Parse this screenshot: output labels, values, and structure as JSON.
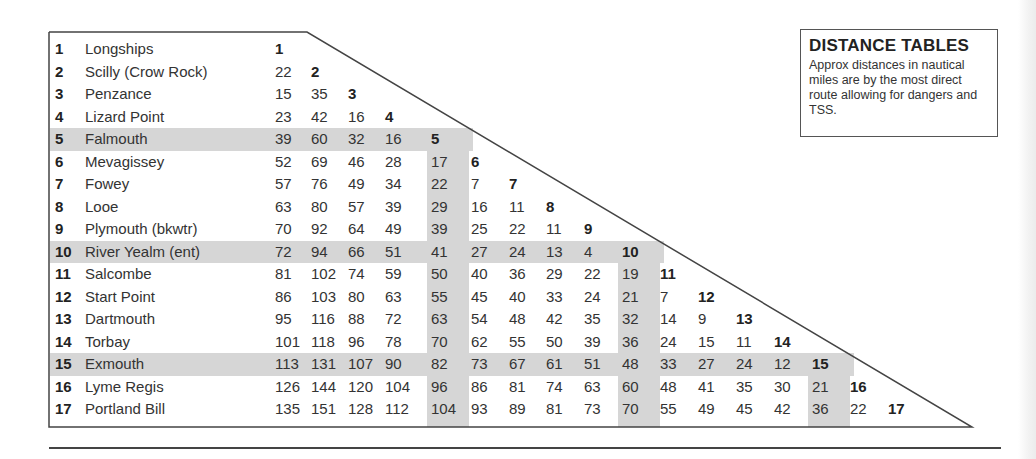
{
  "info_box": {
    "title": "DISTANCE TABLES",
    "text": "Approx distances in nautical miles are by the most direct route allowing for dangers and TSS."
  },
  "places": [
    {
      "num": "1",
      "name": "Longships"
    },
    {
      "num": "2",
      "name": "Scilly (Crow Rock)"
    },
    {
      "num": "3",
      "name": "Penzance"
    },
    {
      "num": "4",
      "name": "Lizard Point"
    },
    {
      "num": "5",
      "name": "Falmouth"
    },
    {
      "num": "6",
      "name": "Mevagissey"
    },
    {
      "num": "7",
      "name": "Fowey"
    },
    {
      "num": "8",
      "name": "Looe"
    },
    {
      "num": "9",
      "name": "Plymouth (bkwtr)"
    },
    {
      "num": "10",
      "name": "River Yealm (ent)"
    },
    {
      "num": "11",
      "name": "Salcombe"
    },
    {
      "num": "12",
      "name": "Start Point"
    },
    {
      "num": "13",
      "name": "Dartmouth"
    },
    {
      "num": "14",
      "name": "Torbay"
    },
    {
      "num": "15",
      "name": "Exmouth"
    },
    {
      "num": "16",
      "name": "Lyme Regis"
    },
    {
      "num": "17",
      "name": "Portland Bill"
    }
  ],
  "shaded_rows": [
    5,
    10,
    15
  ],
  "shaded_cols": [
    5,
    10,
    15
  ],
  "distances": [
    [
      "1"
    ],
    [
      "22",
      "2"
    ],
    [
      "15",
      "35",
      "3"
    ],
    [
      "23",
      "42",
      "16",
      "4"
    ],
    [
      "39",
      "60",
      "32",
      "16",
      "5"
    ],
    [
      "52",
      "69",
      "46",
      "28",
      "17",
      "6"
    ],
    [
      "57",
      "76",
      "49",
      "34",
      "22",
      "7",
      "7"
    ],
    [
      "63",
      "80",
      "57",
      "39",
      "29",
      "16",
      "11",
      "8"
    ],
    [
      "70",
      "92",
      "64",
      "49",
      "39",
      "25",
      "22",
      "11",
      "9"
    ],
    [
      "72",
      "94",
      "66",
      "51",
      "41",
      "27",
      "24",
      "13",
      "4",
      "10"
    ],
    [
      "81",
      "102",
      "74",
      "59",
      "50",
      "40",
      "36",
      "29",
      "22",
      "19",
      "11"
    ],
    [
      "86",
      "103",
      "80",
      "63",
      "55",
      "45",
      "40",
      "33",
      "24",
      "21",
      "7",
      "12"
    ],
    [
      "95",
      "116",
      "88",
      "72",
      "63",
      "54",
      "48",
      "42",
      "35",
      "32",
      "14",
      "9",
      "13"
    ],
    [
      "101",
      "118",
      "96",
      "78",
      "70",
      "62",
      "55",
      "50",
      "39",
      "36",
      "24",
      "15",
      "11",
      "14"
    ],
    [
      "113",
      "131",
      "107",
      "90",
      "82",
      "73",
      "67",
      "61",
      "51",
      "48",
      "33",
      "27",
      "24",
      "12",
      "15"
    ],
    [
      "126",
      "144",
      "120",
      "104",
      "96",
      "86",
      "81",
      "74",
      "63",
      "60",
      "48",
      "41",
      "35",
      "30",
      "21",
      "16"
    ],
    [
      "135",
      "151",
      "128",
      "112",
      "104",
      "93",
      "89",
      "81",
      "73",
      "70",
      "55",
      "49",
      "45",
      "42",
      "36",
      "22",
      "17"
    ]
  ],
  "colors": {
    "shade": "#d6d6d6",
    "line": "#444444",
    "text": "#333333"
  }
}
